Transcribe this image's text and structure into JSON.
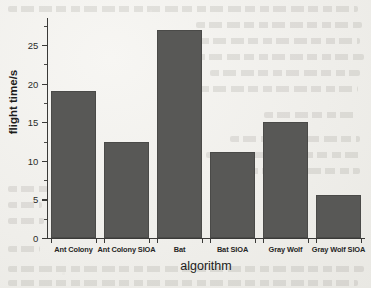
{
  "chart_data": {
    "type": "bar",
    "title": "",
    "xlabel": "algorithm",
    "ylabel": "flight time/s",
    "categories": [
      "Ant Colony",
      "Ant Colony SIOA",
      "Bat",
      "Bat SIOA",
      "Gray Wolf",
      "Gray Wolf SIOA"
    ],
    "values": [
      19.0,
      12.5,
      27.0,
      11.2,
      15.0,
      5.6
    ],
    "ylim": [
      0,
      28.5
    ],
    "ytick_labels": [
      "0",
      "5",
      "10",
      "15",
      "20",
      "25"
    ],
    "ytick_values": [
      0,
      5,
      10,
      15,
      20,
      25
    ],
    "yminor_values": [
      2.5,
      7.5,
      12.5,
      17.5,
      22.5,
      27.5
    ],
    "grid": false,
    "legend": "none",
    "bar_color": "#585856",
    "bar_edge_color": "#4a4a48",
    "axis_color": "#3a3a38",
    "background_color": "#efeeea"
  },
  "page": {
    "media": "scanned-paper",
    "bleed_through_text_visible": true
  }
}
